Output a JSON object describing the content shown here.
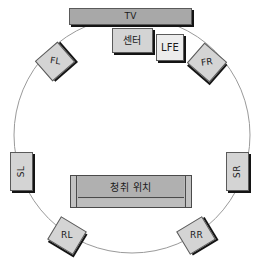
{
  "diagram": {
    "circle": {
      "center_x": 132,
      "center_y": 135,
      "radius": 118,
      "stroke": "#9a9a9a"
    },
    "colors": {
      "box_fill": "#d4d4d4",
      "box_light_fill": "#ececec",
      "box_dark_fill": "#a8a8a8",
      "box_border": "#5a5a5a",
      "box_shadow": "#141414",
      "sofa_fill": "#b9b9b9",
      "background": "#ffffff"
    },
    "elements": {
      "tv": {
        "label": "TV",
        "name": "tv-panel"
      },
      "center": {
        "label": "센터",
        "name": "center-speaker"
      },
      "lfe": {
        "label": "LFE",
        "name": "lfe-subwoofer"
      },
      "fl": {
        "label": "FL",
        "name": "front-left-speaker"
      },
      "fr": {
        "label": "FR",
        "name": "front-right-speaker"
      },
      "sl": {
        "label": "SL",
        "name": "surround-left-speaker"
      },
      "sr": {
        "label": "SR",
        "name": "surround-right-speaker"
      },
      "rl": {
        "label": "RL",
        "name": "rear-left-speaker"
      },
      "rr": {
        "label": "RR",
        "name": "rear-right-speaker"
      },
      "listening_position": {
        "label": "청취 위치",
        "name": "listening-position"
      }
    }
  }
}
